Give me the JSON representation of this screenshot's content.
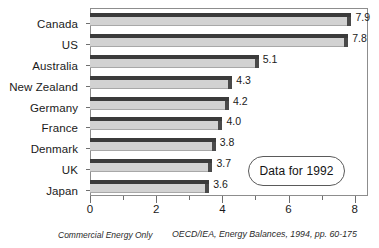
{
  "chart_data": {
    "type": "bar",
    "orientation": "horizontal",
    "title": "",
    "subtitle": "",
    "xlabel": "",
    "ylabel": "",
    "categories": [
      "Canada",
      "US",
      "Australia",
      "New Zealand",
      "Germany",
      "France",
      "Denmark",
      "UK",
      "Japan"
    ],
    "values": [
      7.9,
      7.8,
      5.1,
      4.3,
      4.2,
      4.0,
      3.8,
      3.7,
      3.6
    ],
    "value_labels": [
      "7.9",
      "7.8",
      "5.1",
      "4.3",
      "4.2",
      "4.0",
      "3.8",
      "3.7",
      "3.6"
    ],
    "xlim": [
      0,
      8.4
    ],
    "xticks": [
      0,
      2,
      4,
      6,
      8
    ],
    "xtick_labels": [
      "0",
      "2",
      "4",
      "6",
      "8"
    ],
    "xticks_minor": [
      1,
      3,
      5,
      7
    ],
    "grid": false,
    "legend": null,
    "annotations": [
      "Data for 1992"
    ],
    "colors": {
      "bar_face": "#d2d2d2",
      "bar_top": "#3b3b3b",
      "bar_side": "#4a4a4a",
      "frame": "#8d8d8d",
      "text": "#1a1a1a",
      "background": "#ffffff"
    }
  },
  "callout": {
    "label": "Data for 1992"
  },
  "footnotes": {
    "left": "Commercial Energy Only",
    "right": "OECD/IEA, Energy Balances, 1994, pp. 60-175"
  }
}
